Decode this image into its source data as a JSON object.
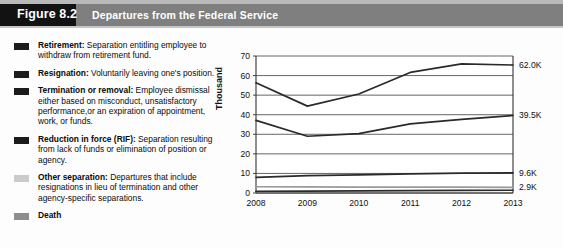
{
  "header": {
    "figure_badge": "Figure 8.2",
    "title": "Departures from the Federal Service"
  },
  "legend": {
    "items": [
      {
        "term": "Retirement:",
        "description": " Separation entitling employee to withdraw from retirement fund.",
        "color": "#1c1c1c"
      },
      {
        "term": "Resignation:",
        "description": " Voluntarily leaving one's position.",
        "color": "#1c1c1c"
      },
      {
        "term": "Termination or removal:",
        "description": " Employee dismissal either based on misconduct, unsatisfactory performance,or an expiration of appointment, work, or funds.",
        "color": "#1c1c1c"
      },
      {
        "term": "Reduction in force (RIF):",
        "description": " Separation resulting from lack of funds or elimination of position or agency.",
        "color": "#1c1c1c"
      },
      {
        "term": "Other separation:",
        "description": " Departures that include resignations in lieu of termination and other agency-specific separations.",
        "color": "#cbcbcb"
      },
      {
        "term": "Death",
        "description": "",
        "color": "#8e8e8e"
      }
    ]
  },
  "chart_data": {
    "type": "line",
    "title": "Departures from the Federal Service",
    "xlabel": "",
    "ylabel": "Thousand",
    "categories": [
      "2008",
      "2009",
      "2010",
      "2011",
      "2012",
      "2013"
    ],
    "x": [
      2008,
      2009,
      2010,
      2011,
      2012,
      2013
    ],
    "ylim": [
      0,
      70
    ],
    "yticks": [
      0,
      10,
      20,
      30,
      40,
      50,
      60,
      70
    ],
    "ytick_labels": [
      "0",
      "10",
      "20",
      "30",
      "40",
      "50",
      "60",
      "70"
    ],
    "grid": true,
    "legend_position": "left-external",
    "series": [
      {
        "name": "Resignation",
        "color": "#2a2a2a",
        "values": [
          56.3,
          44.4,
          50.6,
          61.6,
          66.0,
          65.4
        ],
        "end_label": "62.0K"
      },
      {
        "name": "Retirement",
        "color": "#2a2a2a",
        "values": [
          37.1,
          29.0,
          30.3,
          35.3,
          37.6,
          39.6
        ],
        "end_label": "39.5K"
      },
      {
        "name": "Termination or removal",
        "color": "#2a2a2a",
        "values": [
          8.0,
          8.9,
          9.3,
          9.8,
          10.2,
          10.3
        ],
        "end_label": "9.6K"
      },
      {
        "name": "Other separation",
        "color": "#9a9a9a",
        "values": [
          3.2,
          3.1,
          3.0,
          3.0,
          3.0,
          2.9
        ],
        "end_label": "2.9K"
      },
      {
        "name": "Reduction in force (RIF) / Death",
        "color": "#2a2a2a",
        "values": [
          0.9,
          1.0,
          1.1,
          1.2,
          1.3,
          1.4
        ],
        "end_label": ""
      }
    ],
    "end_labels": [
      "62.0K",
      "39.5K",
      "9.6K",
      "2.9K"
    ]
  }
}
